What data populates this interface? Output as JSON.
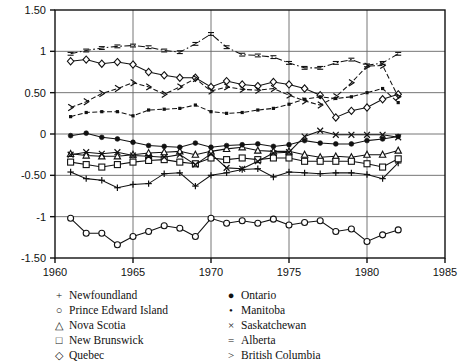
{
  "chart_data": {
    "type": "line",
    "title": "",
    "xlabel": "",
    "ylabel": "",
    "xlim": [
      1960,
      1985
    ],
    "ylim": [
      -1.5,
      1.5
    ],
    "xticks": [
      1960,
      1965,
      1970,
      1975,
      1980,
      1985
    ],
    "yticks": [
      -1.5,
      -1,
      -0.5,
      0,
      0.5,
      1,
      1.5
    ],
    "ytick_labels": [
      "-1.50",
      "-1",
      "-0.50",
      "0",
      "0.50",
      "1",
      "1.50"
    ],
    "grid": "vertical and horizontal gridlines at ticks",
    "legend_position": "below-plot",
    "x": [
      1961,
      1962,
      1963,
      1964,
      1965,
      1966,
      1967,
      1968,
      1969,
      1970,
      1971,
      1972,
      1973,
      1974,
      1975,
      1976,
      1977,
      1978,
      1979,
      1980,
      1981,
      1982
    ],
    "series": [
      {
        "name": "Newfoundland",
        "marker": "+",
        "values": [
          -0.46,
          -0.54,
          -0.56,
          -0.65,
          -0.61,
          -0.6,
          -0.48,
          -0.47,
          -0.63,
          -0.5,
          -0.47,
          -0.43,
          -0.42,
          -0.52,
          -0.46,
          -0.47,
          -0.48,
          -0.47,
          -0.47,
          -0.49,
          -0.54,
          -0.35
        ]
      },
      {
        "name": "Prince Edward Island",
        "marker": "o",
        "values": [
          -1.02,
          -1.2,
          -1.2,
          -1.34,
          -1.24,
          -1.18,
          -1.11,
          -1.14,
          -1.24,
          -1.02,
          -1.08,
          -1.05,
          -1.08,
          -1.03,
          -1.1,
          -1.07,
          -1.05,
          -1.18,
          -1.15,
          -1.3,
          -1.22,
          -1.16
        ]
      },
      {
        "name": "Nova Scotia",
        "marker": "triangle",
        "values": [
          -0.24,
          -0.26,
          -0.27,
          -0.27,
          -0.25,
          -0.23,
          -0.22,
          -0.21,
          -0.25,
          -0.21,
          -0.18,
          -0.16,
          -0.2,
          -0.21,
          -0.21,
          -0.25,
          -0.28,
          -0.27,
          -0.28,
          -0.25,
          -0.25,
          -0.2
        ]
      },
      {
        "name": "New Brunswick",
        "marker": "square",
        "values": [
          -0.34,
          -0.37,
          -0.4,
          -0.37,
          -0.34,
          -0.32,
          -0.31,
          -0.34,
          -0.36,
          -0.29,
          -0.31,
          -0.29,
          -0.31,
          -0.29,
          -0.29,
          -0.33,
          -0.33,
          -0.33,
          -0.33,
          -0.36,
          -0.4,
          -0.3
        ]
      },
      {
        "name": "Quebec",
        "marker": "diamond",
        "values": [
          0.88,
          0.9,
          0.85,
          0.87,
          0.84,
          0.75,
          0.71,
          0.68,
          0.68,
          0.57,
          0.64,
          0.6,
          0.58,
          0.63,
          0.6,
          0.55,
          0.47,
          0.2,
          0.28,
          0.32,
          0.42,
          0.48
        ]
      },
      {
        "name": "Ontario",
        "marker": "filled-circle",
        "values": [
          -0.02,
          0.01,
          -0.04,
          -0.06,
          -0.1,
          -0.14,
          -0.15,
          -0.16,
          -0.11,
          -0.16,
          -0.14,
          -0.13,
          -0.12,
          -0.15,
          -0.13,
          -0.08,
          -0.11,
          -0.12,
          -0.12,
          -0.08,
          -0.06,
          -0.03
        ]
      },
      {
        "name": "Manitoba",
        "marker": "small-dot",
        "values": [
          0.21,
          0.26,
          0.27,
          0.27,
          0.22,
          0.29,
          0.3,
          0.31,
          0.35,
          0.27,
          0.25,
          0.26,
          0.29,
          0.31,
          0.36,
          0.42,
          0.45,
          0.43,
          0.45,
          0.5,
          0.55,
          0.38
        ]
      },
      {
        "name": "Saskatchewan",
        "marker": "x",
        "values": [
          -0.25,
          -0.22,
          -0.24,
          -0.22,
          -0.26,
          -0.27,
          -0.28,
          -0.25,
          -0.37,
          -0.24,
          -0.41,
          -0.42,
          -0.33,
          -0.23,
          -0.22,
          -0.03,
          0.04,
          -0.01,
          -0.01,
          -0.01,
          -0.01,
          -0.04
        ]
      },
      {
        "name": "Alberta",
        "marker": "=",
        "values": [
          0.97,
          1.01,
          1.04,
          1.06,
          1.07,
          1.05,
          1.01,
          0.99,
          1.09,
          1.21,
          1.05,
          0.96,
          0.95,
          0.93,
          0.86,
          0.8,
          0.8,
          0.86,
          0.9,
          0.83,
          0.86,
          0.97
        ]
      },
      {
        "name": "British Columbia",
        "marker": ">",
        "values": [
          0.32,
          0.39,
          0.49,
          0.55,
          0.62,
          0.57,
          0.48,
          0.57,
          0.67,
          0.52,
          0.57,
          0.54,
          0.53,
          0.55,
          0.47,
          0.4,
          0.35,
          0.45,
          0.62,
          0.82,
          0.83,
          0.45
        ]
      }
    ]
  },
  "legend": {
    "left_column": [
      {
        "symbol": "+",
        "label": "Newfoundland"
      },
      {
        "symbol": "○",
        "label": "Prince Edward Island"
      },
      {
        "symbol": "△",
        "label": "Nova Scotia"
      },
      {
        "symbol": "□",
        "label": "New Brunswick"
      },
      {
        "symbol": "◇",
        "label": "Quebec"
      }
    ],
    "right_column": [
      {
        "symbol": "●",
        "label": "Ontario"
      },
      {
        "symbol": "•",
        "label": "Manitoba"
      },
      {
        "symbol": "×",
        "label": "Saskatchewan"
      },
      {
        "symbol": "=",
        "label": "Alberta"
      },
      {
        "symbol": ">",
        "label": "British Columbia"
      }
    ]
  },
  "colors": {
    "line": "#111111",
    "axis": "#111111",
    "grid": "#666666",
    "background": "#ffffff"
  }
}
